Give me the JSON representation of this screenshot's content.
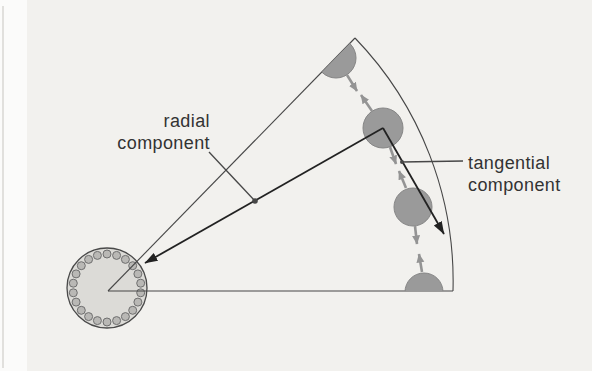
{
  "diagram": {
    "labels": {
      "radial_line1": "radial",
      "radial_line2": "component",
      "tangential_line1": "tangential",
      "tangential_line2": "component"
    },
    "colors": {
      "page_bg": "#f2f1ee",
      "margin_bg": "#fbfbfa",
      "edge_line": "#d9d7d3",
      "line": "#474747",
      "arrow_black": "#222222",
      "ball_fill": "#9a9a9a",
      "ball_stroke": "#858585",
      "gray_arrow": "#949494",
      "hub_fill": "#dcdbd7",
      "hub_stroke": "#4a4a4a",
      "bead_fill": "#b9b8b5",
      "bead_stroke": "#6f6f6f",
      "text": "#333333"
    }
  }
}
